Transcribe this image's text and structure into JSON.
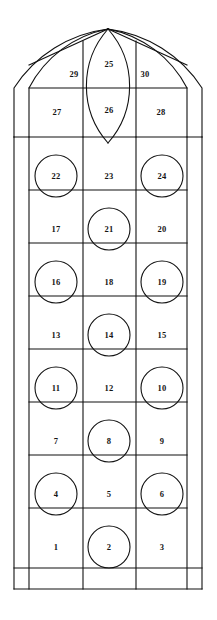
{
  "figure": {
    "background_color": "#ffffff",
    "line_color": "#111111",
    "label_color": "#141414",
    "width": 217,
    "height": 620
  },
  "geometry": {
    "outer_frame": {
      "left": 14,
      "right": 202,
      "top_springline": 137,
      "bottom": 589
    },
    "inner_frame": {
      "left": 29,
      "right": 187,
      "bottom_inner": 568
    },
    "columns": [
      29,
      83,
      136,
      187
    ],
    "row_lines": [
      137,
      190,
      243,
      296,
      349,
      402,
      455,
      508,
      561,
      568,
      589
    ],
    "arch_apex": {
      "x": 108,
      "y": 29
    },
    "arch_springline_y": 88
  },
  "panels": [
    {
      "id": "panel-1",
      "label": "1",
      "x": 56,
      "y": 547,
      "shape": "rect"
    },
    {
      "id": "panel-2",
      "label": "2",
      "x": 109,
      "y": 547,
      "shape": "circle"
    },
    {
      "id": "panel-3",
      "label": "3",
      "x": 162,
      "y": 547,
      "shape": "rect"
    },
    {
      "id": "panel-4",
      "label": "4",
      "x": 56,
      "y": 494,
      "shape": "circle"
    },
    {
      "id": "panel-5",
      "label": "5",
      "x": 109,
      "y": 494,
      "shape": "rect"
    },
    {
      "id": "panel-6",
      "label": "6",
      "x": 162,
      "y": 494,
      "shape": "circle"
    },
    {
      "id": "panel-7",
      "label": "7",
      "x": 56,
      "y": 441,
      "shape": "rect"
    },
    {
      "id": "panel-8",
      "label": "8",
      "x": 109,
      "y": 441,
      "shape": "circle"
    },
    {
      "id": "panel-9",
      "label": "9",
      "x": 162,
      "y": 441,
      "shape": "rect"
    },
    {
      "id": "panel-10",
      "label": "10",
      "x": 162,
      "y": 388,
      "shape": "circle"
    },
    {
      "id": "panel-11",
      "label": "11",
      "x": 56,
      "y": 388,
      "shape": "circle"
    },
    {
      "id": "panel-12",
      "label": "12",
      "x": 109,
      "y": 388,
      "shape": "rect"
    },
    {
      "id": "panel-13",
      "label": "13",
      "x": 56,
      "y": 335,
      "shape": "rect"
    },
    {
      "id": "panel-14",
      "label": "14",
      "x": 109,
      "y": 335,
      "shape": "circle"
    },
    {
      "id": "panel-15",
      "label": "15",
      "x": 162,
      "y": 335,
      "shape": "rect"
    },
    {
      "id": "panel-16",
      "label": "16",
      "x": 56,
      "y": 282,
      "shape": "circle"
    },
    {
      "id": "panel-17",
      "label": "17",
      "x": 56,
      "y": 229,
      "shape": "rect"
    },
    {
      "id": "panel-18",
      "label": "18",
      "x": 109,
      "y": 282,
      "shape": "rect"
    },
    {
      "id": "panel-19",
      "label": "19",
      "x": 162,
      "y": 282,
      "shape": "circle"
    },
    {
      "id": "panel-20",
      "label": "20",
      "x": 162,
      "y": 229,
      "shape": "rect"
    },
    {
      "id": "panel-21",
      "label": "21",
      "x": 109,
      "y": 229,
      "shape": "circle"
    },
    {
      "id": "panel-22",
      "label": "22",
      "x": 56,
      "y": 176,
      "shape": "circle"
    },
    {
      "id": "panel-23",
      "label": "23",
      "x": 109,
      "y": 176,
      "shape": "rect"
    },
    {
      "id": "panel-24",
      "label": "24",
      "x": 162,
      "y": 176,
      "shape": "circle"
    },
    {
      "id": "panel-25",
      "label": "25",
      "x": 109,
      "y": 64,
      "shape": "vesica-upper"
    },
    {
      "id": "panel-26",
      "label": "26",
      "x": 109,
      "y": 110,
      "shape": "vesica-lower"
    },
    {
      "id": "panel-27",
      "label": "27",
      "x": 57,
      "y": 112,
      "shape": "tracery"
    },
    {
      "id": "panel-28",
      "label": "28",
      "x": 161,
      "y": 112,
      "shape": "tracery"
    },
    {
      "id": "panel-29",
      "label": "29",
      "x": 74,
      "y": 74,
      "shape": "spandrel"
    },
    {
      "id": "panel-30",
      "label": "30",
      "x": 145,
      "y": 74,
      "shape": "spandrel"
    }
  ],
  "roundels": [
    {
      "cx": 56,
      "cy": 176,
      "r": 21
    },
    {
      "cx": 162,
      "cy": 176,
      "r": 21
    },
    {
      "cx": 109,
      "cy": 229,
      "r": 21
    },
    {
      "cx": 56,
      "cy": 282,
      "r": 21
    },
    {
      "cx": 162,
      "cy": 282,
      "r": 21
    },
    {
      "cx": 109,
      "cy": 335,
      "r": 21
    },
    {
      "cx": 56,
      "cy": 388,
      "r": 21
    },
    {
      "cx": 162,
      "cy": 388,
      "r": 21
    },
    {
      "cx": 109,
      "cy": 441,
      "r": 21
    },
    {
      "cx": 56,
      "cy": 494,
      "r": 21
    },
    {
      "cx": 162,
      "cy": 494,
      "r": 21
    },
    {
      "cx": 109,
      "cy": 547,
      "r": 21
    }
  ]
}
